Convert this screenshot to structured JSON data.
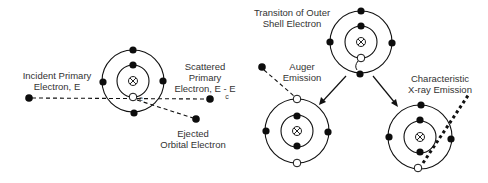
{
  "diagram": {
    "panels": {
      "ionization": {
        "incident_label": [
          "Incident Primary",
          "Electron, E"
        ],
        "scattered_label": [
          "Scattered",
          "Primary",
          "Electron, E - E"
        ],
        "scattered_subscript": "c",
        "ejected_label": [
          "Ejected",
          "Orbital Electron"
        ],
        "vacancy_mark": "e"
      },
      "transition": {
        "label": [
          "Transiton of Outer",
          "Shell Electron"
        ]
      },
      "auger": {
        "label": [
          "Auger",
          "Emission"
        ]
      },
      "xray": {
        "label": [
          "Characteristic",
          "X-ray Emission"
        ]
      }
    },
    "icons": {
      "nucleus": "nucleus-icon",
      "electron": "electron-icon",
      "vacancy": "vacancy-icon"
    },
    "colors": {
      "line": "#111111",
      "text": "#333333",
      "background": "#ffffff"
    }
  }
}
